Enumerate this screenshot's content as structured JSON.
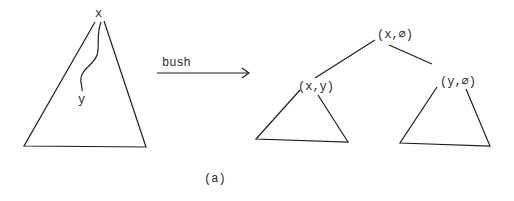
{
  "diagram": {
    "left_tree": {
      "root_label": "x",
      "path_end_label": "y"
    },
    "arrow": {
      "label": "bush"
    },
    "right_tree": {
      "root_label": "(x,∅)",
      "left_child_label": "(x,y)",
      "right_child_label": "(y,∅)"
    },
    "caption": "(a)"
  }
}
